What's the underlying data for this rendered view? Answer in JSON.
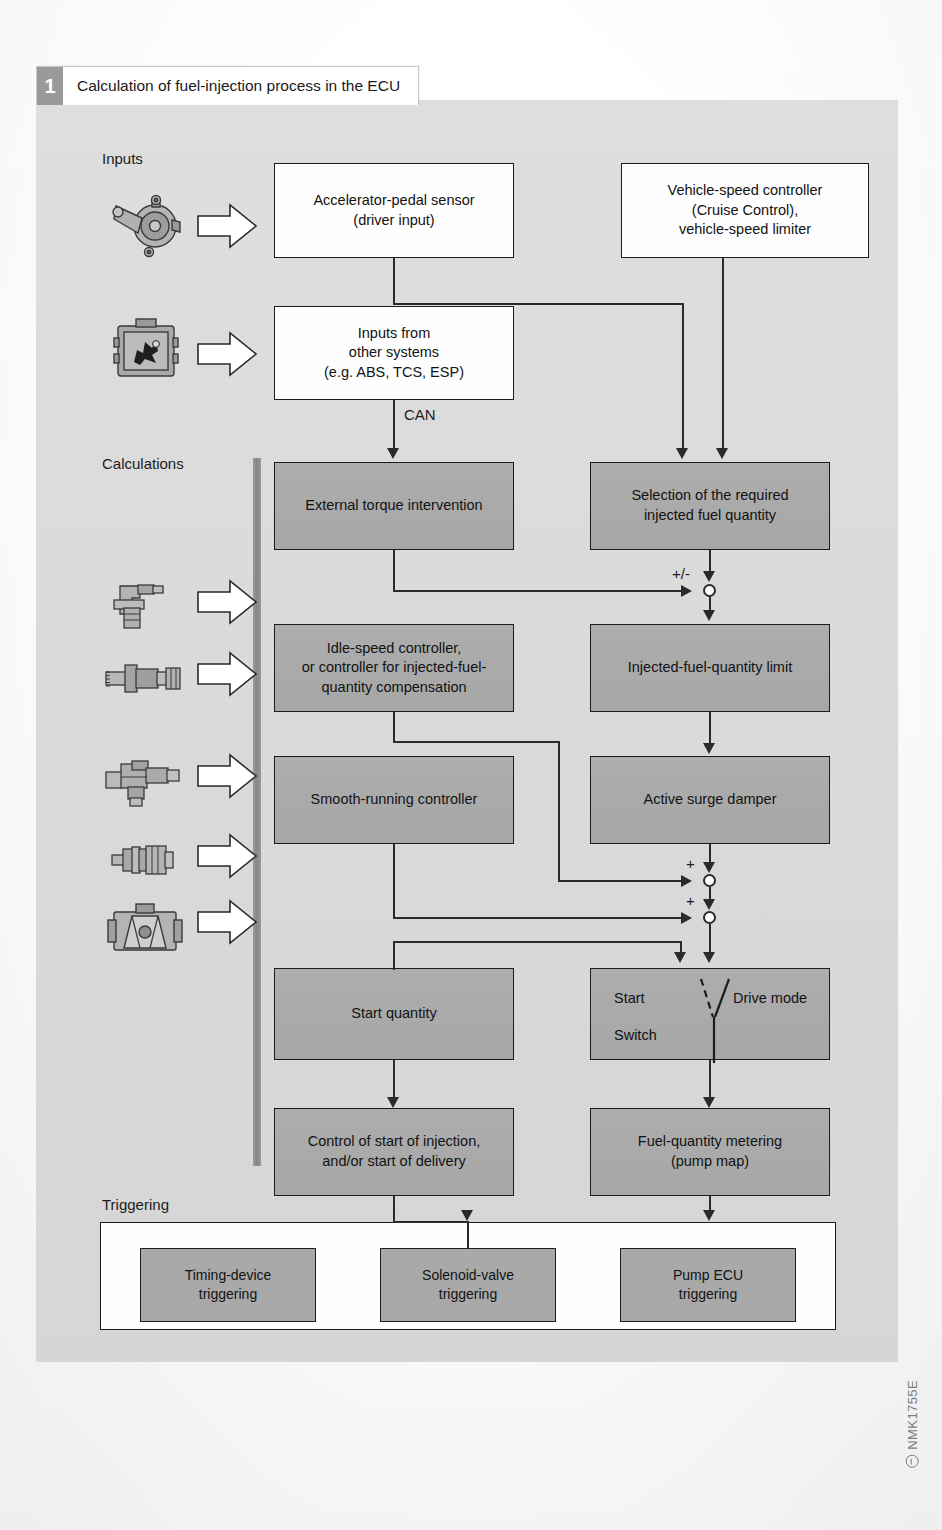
{
  "figure": {
    "number": "1",
    "title": "Calculation of fuel-injection process in the ECU",
    "code": "NMK1755E"
  },
  "sections": {
    "inputs": "Inputs",
    "calculations": "Calculations",
    "triggering": "Triggering"
  },
  "colors": {
    "panel_background": "#dcdcdc",
    "process_box": "#a9a9a9",
    "input_box": "#fefefe",
    "line": "#2a2a2a",
    "spine": "#8e8e8e",
    "figure_badge": "#9a9a9a"
  },
  "input_boxes": [
    {
      "id": "accelerator-pedal-sensor",
      "line1": "Accelerator-pedal sensor",
      "line2": "(driver input)"
    },
    {
      "id": "vehicle-speed-controller",
      "line1": "Vehicle-speed controller",
      "line2": "(Cruise Control),",
      "line3": "vehicle-speed limiter"
    },
    {
      "id": "inputs-other-systems",
      "line1": "Inputs from",
      "line2": "other systems",
      "line3": "(e.g. ABS, TCS, ESP)"
    }
  ],
  "calc_boxes": [
    {
      "id": "external-torque-intervention",
      "line1": "External torque intervention"
    },
    {
      "id": "selection-required-injected-fuel-quantity",
      "line1": "Selection of the required",
      "line2": "injected fuel quantity"
    },
    {
      "id": "idle-speed-controller",
      "line1": "Idle-speed controller,",
      "line2": "or controller for injected-fuel-",
      "line3": "quantity compensation"
    },
    {
      "id": "injected-fuel-quantity-limit",
      "line1": "Injected-fuel-quantity limit"
    },
    {
      "id": "smooth-running-controller",
      "line1": "Smooth-running controller"
    },
    {
      "id": "active-surge-damper",
      "line1": "Active surge damper"
    },
    {
      "id": "start-quantity",
      "line1": "Start quantity"
    },
    {
      "id": "control-start-of-injection",
      "line1": "Control of start of injection,",
      "line2": "and/or start of delivery"
    },
    {
      "id": "fuel-quantity-metering",
      "line1": "Fuel-quantity metering",
      "line2": "(pump map)"
    }
  ],
  "switch_box": {
    "id": "start-drive-mode-switch",
    "start_label": "Start",
    "drive_mode_label": "Drive mode",
    "switch_label": "Switch"
  },
  "trigger_boxes": [
    {
      "id": "timing-device-triggering",
      "line1": "Timing-device",
      "line2": "triggering"
    },
    {
      "id": "solenoid-valve-triggering",
      "line1": "Solenoid-valve",
      "line2": "triggering"
    },
    {
      "id": "pump-ecu-triggering",
      "line1": "Pump ECU",
      "line2": "triggering"
    }
  ],
  "edge_labels": {
    "can": "CAN",
    "plus_minus": "+/-",
    "plus_1": "+",
    "plus_2": "+"
  },
  "sensor_icons": [
    {
      "id": "accelerator-pedal-sensor-icon",
      "name": "accelerator-pedal-sensor-icon"
    },
    {
      "id": "ecu-module-icon",
      "name": "ecu-module-icon"
    },
    {
      "id": "speed-sensor-icon",
      "name": "speed-sensor-icon"
    },
    {
      "id": "temperature-sensor-icon",
      "name": "temperature-sensor-icon"
    },
    {
      "id": "pressure-sensor-icon",
      "name": "pressure-sensor-icon"
    },
    {
      "id": "coolant-sensor-icon",
      "name": "coolant-sensor-icon"
    },
    {
      "id": "air-mass-meter-icon",
      "name": "air-mass-meter-icon"
    }
  ]
}
